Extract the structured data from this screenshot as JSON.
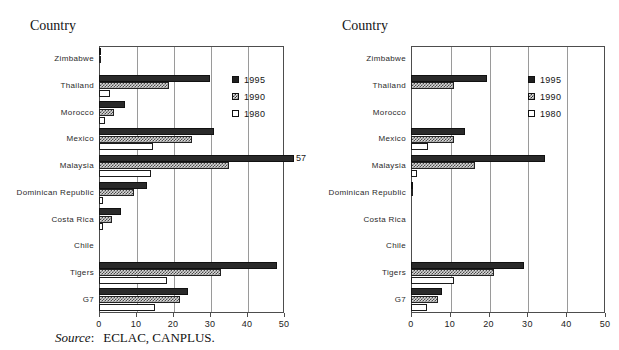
{
  "page": {
    "top_cut_text": "",
    "source_keyword": "Source",
    "source_separator": ":",
    "source_body": "ECLAC, CANPLUS."
  },
  "legend": {
    "items": [
      {
        "label": "1995",
        "swatch": "solid-black-swatch"
      },
      {
        "label": "1990",
        "swatch": "hatched-gray-swatch"
      },
      {
        "label": "1980",
        "swatch": "white-swatch"
      }
    ]
  },
  "chart_data": [
    {
      "id": "left-chart",
      "type": "bar",
      "orientation": "horizontal",
      "title": "",
      "ylabel": "Country",
      "xlabel": "",
      "xlim": [
        0,
        50
      ],
      "xticks": [
        0,
        10,
        20,
        30,
        40,
        50
      ],
      "grid": true,
      "legend_position": "inside-top-right",
      "categories": [
        "Zimbabwe",
        "Thailand",
        "Morocco",
        "Mexico",
        "Malaysia",
        "Dominican Republic",
        "Costa Rica",
        "Chile",
        "Tigers",
        "G7"
      ],
      "series": [
        {
          "name": "1995",
          "values": [
            0.6,
            30.0,
            7.0,
            31.0,
            57.0,
            13.0,
            6.0,
            0.0,
            48.0,
            24.0
          ]
        },
        {
          "name": "1990",
          "values": [
            0.5,
            19.0,
            4.0,
            25.0,
            35.0,
            9.5,
            3.5,
            0.0,
            33.0,
            22.0
          ]
        },
        {
          "name": "1980",
          "values": [
            0.0,
            3.0,
            1.5,
            14.5,
            14.0,
            1.0,
            1.0,
            0.0,
            18.5,
            15.0
          ]
        }
      ],
      "annotations": [
        {
          "text": "57",
          "series": "1995",
          "category": "Malaysia",
          "value": 57.0
        }
      ]
    },
    {
      "id": "right-chart",
      "type": "bar",
      "orientation": "horizontal",
      "title": "",
      "ylabel": "Country",
      "xlabel": "",
      "xlim": [
        0,
        50
      ],
      "xticks": [
        0,
        10,
        20,
        30,
        40,
        50
      ],
      "grid": true,
      "legend_position": "inside-top-right",
      "categories": [
        "Zimbabwe",
        "Thailand",
        "Morocco",
        "Mexico",
        "Malaysia",
        "Dominican Republic",
        "Costa Rica",
        "Chile",
        "Tigers",
        "G7"
      ],
      "series": [
        {
          "name": "1995",
          "values": [
            0.0,
            19.5,
            0.0,
            14.0,
            34.5,
            0.6,
            0.0,
            0.0,
            29.0,
            8.0
          ]
        },
        {
          "name": "1990",
          "values": [
            0.0,
            11.0,
            0.0,
            11.0,
            16.5,
            0.5,
            0.0,
            0.0,
            21.5,
            7.0
          ]
        },
        {
          "name": "1980",
          "values": [
            0.0,
            0.0,
            0.0,
            4.5,
            1.5,
            0.0,
            0.0,
            0.0,
            11.0,
            4.0
          ]
        }
      ],
      "annotations": []
    }
  ]
}
